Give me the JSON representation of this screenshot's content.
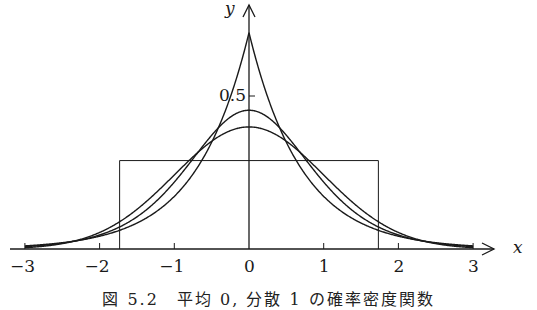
{
  "chart_data": {
    "type": "line",
    "title": "",
    "caption": "図 5.2　平均 0, 分散 1 の確率密度関数",
    "xlabel": "x",
    "ylabel": "y",
    "xlim": [
      -3,
      3
    ],
    "ylim": [
      0,
      0.75
    ],
    "x_ticks": [
      -3,
      -2,
      -1,
      0,
      1,
      2,
      3
    ],
    "x_tick_labels": [
      "−3",
      "−2",
      "−1",
      "0",
      "1",
      "2",
      "3"
    ],
    "y_ticks": [
      0.5
    ],
    "y_tick_labels": [
      "0.5"
    ],
    "grid": false,
    "legend": null,
    "series": [
      {
        "name": "Laplace (variance 1)",
        "kind": "laplace",
        "peak": 0.707,
        "x": [
          -3,
          -2,
          -1,
          -0.5,
          0,
          0.5,
          1,
          2,
          3
        ],
        "values": [
          0.01,
          0.042,
          0.172,
          0.348,
          0.707,
          0.348,
          0.172,
          0.042,
          0.01
        ]
      },
      {
        "name": "Logistic (variance 1)",
        "kind": "logistic",
        "peak": 0.453,
        "x": [
          -3,
          -2,
          -1,
          -0.5,
          0,
          0.5,
          1,
          2,
          3
        ],
        "values": [
          0.015,
          0.07,
          0.257,
          0.399,
          0.453,
          0.399,
          0.257,
          0.07,
          0.015
        ]
      },
      {
        "name": "Normal (mean 0, variance 1)",
        "kind": "normal",
        "peak": 0.399,
        "x": [
          -3,
          -2,
          -1,
          -0.5,
          0,
          0.5,
          1,
          2,
          3
        ],
        "values": [
          0.004,
          0.054,
          0.242,
          0.352,
          0.399,
          0.352,
          0.242,
          0.054,
          0.004
        ]
      },
      {
        "name": "Uniform on [−√3, √3]",
        "kind": "uniform",
        "peak": 0.289,
        "x": [
          -1.732,
          1.732
        ],
        "values": [
          0.289,
          0.289
        ]
      }
    ]
  },
  "axes": {
    "x_name": "x",
    "y_name": "y"
  }
}
